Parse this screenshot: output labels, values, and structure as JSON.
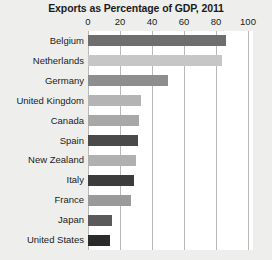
{
  "chart_data": {
    "type": "bar",
    "orientation": "horizontal",
    "title": "Exports as Percentage of GDP, 2011",
    "xlabel": "",
    "ylabel": "",
    "xlim": [
      0,
      100
    ],
    "xticks": [
      0,
      20,
      40,
      60,
      80,
      100
    ],
    "grid": true,
    "legend": "none",
    "categories": [
      "Belgium",
      "Netherlands",
      "Germany",
      "United Kingdom",
      "Canada",
      "Spain",
      "New Zealand",
      "Italy",
      "France",
      "Japan",
      "United States"
    ],
    "values": [
      86,
      84,
      50,
      33,
      32,
      31,
      30,
      29,
      27,
      15,
      14
    ],
    "bar_colors": [
      "#6e6e6e",
      "#c6c6c6",
      "#8e8e8e",
      "#b4b4b4",
      "#a8a8a8",
      "#4a4a4a",
      "#b0b0b0",
      "#3c3c3c",
      "#9a9a9a",
      "#5a5a5a",
      "#2b2b2b"
    ]
  },
  "style": {
    "background": "#eeeeec",
    "plot_background": "#ffffff",
    "gridline_color": "#b8b8b8",
    "text_color": "#1b1b1b"
  }
}
